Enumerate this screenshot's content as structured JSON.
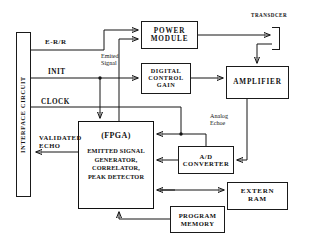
{
  "diagram": {
    "blocks": [
      {
        "id": "interface-circuit",
        "label": "INTERFACE CIRCUIT"
      },
      {
        "id": "power-module",
        "label": "POWER\nMODULE"
      },
      {
        "id": "digital-control-gain",
        "label": "DIGITAL\nCONTROL\nGAIN"
      },
      {
        "id": "amplifier",
        "label": "AMPLIFIER"
      },
      {
        "id": "fpga",
        "title": "(FPGA)",
        "subtitle": "EMITTED SIGNAL\nGENERATOR,\nCORRELATOR,\nPEAK DETECTOR"
      },
      {
        "id": "ad-converter",
        "label": "A/D\nCONVERTER"
      },
      {
        "id": "extern-ram",
        "label": "EXTERN\nRAM"
      },
      {
        "id": "program-memory",
        "label": "PROGRAM\nMEMORY"
      },
      {
        "id": "transducer",
        "label": "TRANSDCER"
      }
    ],
    "labels": {
      "interface_circuit": "INTERFACE CIRCUIT",
      "power_module_l1": "POWER",
      "power_module_l2": "MODULE",
      "digital_control_gain_l1": "DIGITAL",
      "digital_control_gain_l2": "CONTROL",
      "digital_control_gain_l3": "GAIN",
      "amplifier": "AMPLIFIER",
      "fpga_title": "(FPGA)",
      "fpga_sub_l1": "EMITTED SIGNAL",
      "fpga_sub_l2": "GENERATOR,",
      "fpga_sub_l3": "CORRELATOR,",
      "fpga_sub_l4": "PEAK DETECTOR",
      "ad_converter_l1": "A/D",
      "ad_converter_l2": "CONVERTER",
      "extern_ram_l1": "EXTERN",
      "extern_ram_l2": "RAM",
      "program_memory_l1": "PROGRAM",
      "program_memory_l2": "MEMORY",
      "transducer": "TRANSDCER"
    },
    "signals": {
      "e_r_r": "E-R/R",
      "init": "INIT",
      "clock": "CLOCK",
      "validated_echo_l1": "VALIDATED",
      "validated_echo_l2": "ECHO",
      "emited_signal_l1": "Emited",
      "emited_signal_l2": "Signal",
      "analog_echo_l1": "Analog",
      "analog_echo_l2": "Echoe"
    },
    "colors": {
      "background": "#ffffff",
      "stroke": "#141414",
      "text": "#121212"
    }
  }
}
